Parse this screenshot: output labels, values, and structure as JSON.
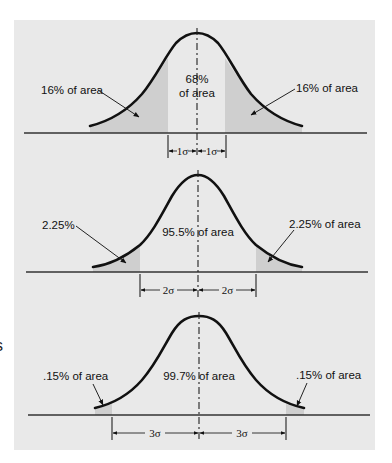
{
  "figure": {
    "colors": {
      "background": "#e9e9e9",
      "shade": "#cfcfcf",
      "ink": "#111111"
    },
    "panels": [
      {
        "id": "one-sigma",
        "left_label": "16% of area",
        "right_label": "16% of area",
        "center_label_line1": "68%",
        "center_label_line2": "of area",
        "left_dim_label": "1σ",
        "right_dim_label": "1σ"
      },
      {
        "id": "two-sigma",
        "left_label": "2.25%",
        "right_label": "2.25% of area",
        "center_label_line1": "95.5% of area",
        "left_dim_label": "2σ",
        "right_dim_label": "2σ"
      },
      {
        "id": "three-sigma",
        "left_label": ".15% of area",
        "right_label": ".15% of area",
        "center_label_line1": "99.7% of area",
        "left_dim_label": "3σ",
        "right_dim_label": "3σ"
      }
    ],
    "margin_fragment": "s"
  }
}
